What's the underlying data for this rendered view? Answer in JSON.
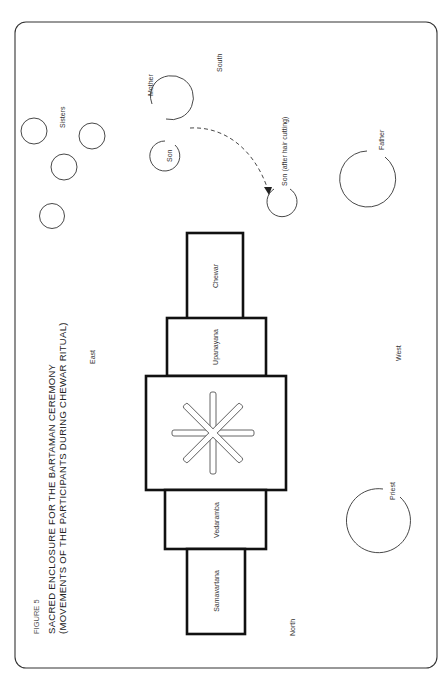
{
  "figure": {
    "number_label": "FIGURE 5",
    "title_line1": "SACRED  ENCLOSURE  FOR  THE  BARTAMAN  CEREMONY",
    "title_line2": "(MOVEMENTS OF THE PARTICIPANTS DURING  CHEWAR RITUAL)"
  },
  "directions": {
    "south": "South",
    "east": "East",
    "west": "West",
    "north": "North"
  },
  "participants": {
    "sisters": "Sisters",
    "mother": "Mother",
    "son": "Son",
    "son_after": "Son (after hair cutting)",
    "father": "Father",
    "priest": "Priest"
  },
  "enclosure": {
    "boxes": [
      {
        "label": "Chewar"
      },
      {
        "label": "Upanayana"
      },
      {
        "label": "Vedaramba"
      },
      {
        "label": "Samavartana"
      }
    ],
    "center_symbol": "eight-armed-star"
  },
  "colors": {
    "line": "#333333",
    "box_stroke": "#111111",
    "background": "#ffffff"
  }
}
